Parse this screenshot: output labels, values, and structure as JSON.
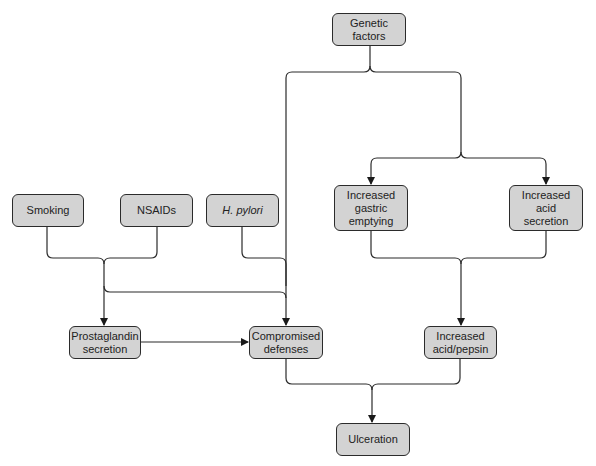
{
  "diagram": {
    "type": "flowchart",
    "nodes": {
      "genetic": "Genetic\nfactors",
      "smoking": "Smoking",
      "nsaids": "NSAIDs",
      "hpylori": "H. pylori",
      "gastric": "Increased\ngastric\nemptying",
      "acid_secretion": "Increased acid\nsecretion",
      "prostaglandin": "Prostaglandin\nsecretion",
      "compromised": "Compromised\ndefenses",
      "acid_pepsin": "Increased\nacid/pepsin",
      "ulceration": "Ulceration"
    },
    "edges": [
      {
        "from": "Genetic factors",
        "to": "Compromised defenses"
      },
      {
        "from": "Genetic factors",
        "to": "Increased gastric emptying"
      },
      {
        "from": "Genetic factors",
        "to": "Increased acid secretion"
      },
      {
        "from": "Smoking",
        "to": "Prostaglandin secretion"
      },
      {
        "from": "NSAIDs",
        "to": "Prostaglandin secretion"
      },
      {
        "from": "Smoking",
        "to": "Compromised defenses"
      },
      {
        "from": "NSAIDs",
        "to": "Compromised defenses"
      },
      {
        "from": "H. pylori",
        "to": "Compromised defenses"
      },
      {
        "from": "Prostaglandin secretion",
        "to": "Compromised defenses"
      },
      {
        "from": "Increased gastric emptying",
        "to": "Increased acid/pepsin"
      },
      {
        "from": "Increased acid secretion",
        "to": "Increased acid/pepsin"
      },
      {
        "from": "Compromised defenses",
        "to": "Ulceration"
      },
      {
        "from": "Increased acid/pepsin",
        "to": "Ulceration"
      }
    ],
    "colors": {
      "node_fill": "#d3d3d3",
      "stroke": "#2b2b2b",
      "background": "#ffffff"
    }
  }
}
